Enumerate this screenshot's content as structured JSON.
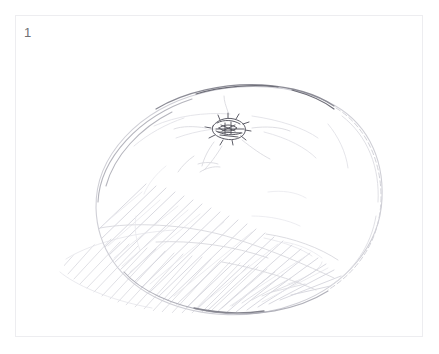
{
  "plate": {
    "figure_number": "1",
    "frame_color": "#ededf0",
    "background_color": "#ffffff",
    "caption": ""
  },
  "drawing": {
    "subject": "tomato",
    "medium": "graphite pencil sketch",
    "description": "Light pencil drawing of a round tomato seen slightly from above, with a dark scribbled stem scar at the upper left of the top face and diagonal hatching shading the lower left of the body and the cast shadow",
    "ink_colors": {
      "outline_light": "#c9c9cf",
      "outline_mid": "#a9a9b2",
      "outline_dark": "#7d7d86",
      "hatching": "#d7d7dd",
      "stem_dark": "#5a5a63"
    },
    "elements": [
      {
        "name": "fruit-outline",
        "label": "Tomato body outline"
      },
      {
        "name": "stem-scar",
        "label": "Stem scar / calyx scribble"
      },
      {
        "name": "stem-whiskers",
        "label": "Faint radiating lines from stem"
      },
      {
        "name": "shadow-contour",
        "label": "Faint contour separating lit and shaded areas"
      },
      {
        "name": "body-hatching",
        "label": "Diagonal hatching on lower-left body"
      },
      {
        "name": "cast-shadow-hatching",
        "label": "Diagonal hatching of cast shadow at lower left"
      }
    ]
  }
}
